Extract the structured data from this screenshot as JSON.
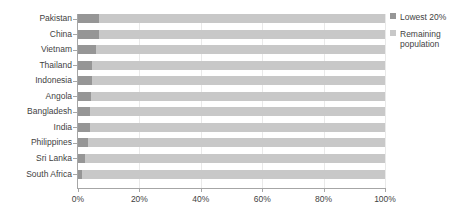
{
  "chart_data": {
    "type": "bar",
    "subtype": "stacked-horizontal-100pct",
    "title": "",
    "xlabel": "",
    "ylabel": "",
    "xlim": [
      0,
      100
    ],
    "xticks": [
      0,
      20,
      40,
      60,
      80,
      100
    ],
    "xticklabels": [
      "0%",
      "20%",
      "40%",
      "60%",
      "80%",
      "100%"
    ],
    "grid": true,
    "legend_position": "right",
    "categories": [
      "Pakistan",
      "China",
      "Vietnam",
      "Thailand",
      "Indonesia",
      "Angola",
      "Bangladesh",
      "India",
      "Philippines",
      "Sri Lanka",
      "South Africa"
    ],
    "series": [
      {
        "name": "Lowest 20%",
        "color": "#969696",
        "values": [
          7.0,
          6.9,
          6.0,
          4.7,
          4.6,
          4.3,
          4.0,
          3.9,
          3.3,
          2.3,
          1.4
        ]
      },
      {
        "name": "Remaining population",
        "color": "#c8c8c8",
        "values": [
          93.0,
          93.1,
          94.0,
          95.3,
          95.4,
          95.7,
          96.0,
          96.1,
          96.7,
          97.7,
          98.6
        ]
      }
    ]
  },
  "legend": {
    "items": [
      {
        "label": "Lowest 20%",
        "color": "#969696"
      },
      {
        "label": "Remaining population",
        "color": "#c8c8c8"
      }
    ]
  },
  "axis": {
    "x_tick_labels": [
      "0%",
      "20%",
      "40%",
      "60%",
      "80%",
      "100%"
    ]
  }
}
